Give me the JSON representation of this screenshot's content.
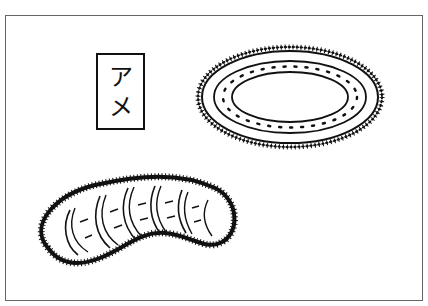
{
  "illustration": {
    "label": {
      "char1": "ア",
      "char2": "メ"
    },
    "objects": [
      {
        "name": "oval-ring-with-spines"
      },
      {
        "name": "kidney-shaped-ribbed-creature"
      }
    ],
    "colors": {
      "ink": "#111111",
      "frame": "#666666",
      "background": "#ffffff"
    }
  }
}
